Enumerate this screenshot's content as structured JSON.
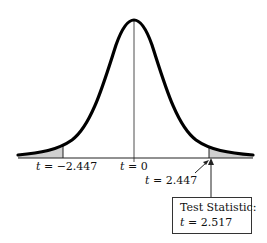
{
  "diagram": {
    "type": "t-distribution-two-tailed-test",
    "labels": {
      "left_critical": {
        "var": "t",
        "eq": " = ",
        "value": "−2.447"
      },
      "center": {
        "var": "t",
        "eq": " = ",
        "value": "0"
      },
      "right_critical": {
        "var": "t",
        "eq": " = ",
        "value": "2.447"
      }
    },
    "test_statistic_box": {
      "title": "Test Statistic:",
      "var": "t",
      "eq": " = ",
      "value": "2.517"
    },
    "colors": {
      "curve": "#000000",
      "shade": "#d0d0d0",
      "axis": "#222222"
    }
  }
}
